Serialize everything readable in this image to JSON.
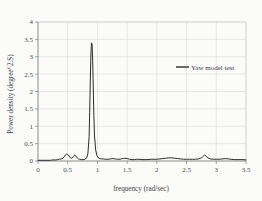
{
  "chart_data": {
    "type": "line",
    "title": "",
    "xlabel": "frequency (rad/sec)",
    "ylabel": "Power density (degree^2.S)",
    "xlim": [
      0,
      3.5
    ],
    "ylim": [
      0,
      4
    ],
    "xticks": [
      "0",
      "0.5",
      "1",
      "1.5",
      "2",
      "2.5",
      "3",
      "3.5"
    ],
    "xtick_values": [
      0,
      0.5,
      1,
      1.5,
      2,
      2.5,
      3,
      3.5
    ],
    "yticks": [
      "0",
      "0.5",
      "1",
      "1.5",
      "2",
      "2.5",
      "3",
      "3.5",
      "4"
    ],
    "ytick_values": [
      0,
      0.5,
      1,
      1.5,
      2,
      2.5,
      3,
      3.5,
      4
    ],
    "grid": true,
    "legend_position": "upper right",
    "series": [
      {
        "name": "Yaw model test",
        "color": "#2b2b2b",
        "x": [
          0.0,
          0.05,
          0.1,
          0.15,
          0.2,
          0.25,
          0.3,
          0.33,
          0.36,
          0.39,
          0.42,
          0.44,
          0.46,
          0.48,
          0.5,
          0.52,
          0.54,
          0.56,
          0.58,
          0.6,
          0.62,
          0.64,
          0.66,
          0.68,
          0.7,
          0.73,
          0.76,
          0.79,
          0.82,
          0.84,
          0.86,
          0.87,
          0.88,
          0.89,
          0.9,
          0.91,
          0.92,
          0.93,
          0.94,
          0.95,
          0.97,
          0.99,
          1.01,
          1.04,
          1.07,
          1.1,
          1.14,
          1.18,
          1.22,
          1.26,
          1.3,
          1.34,
          1.38,
          1.42,
          1.46,
          1.5,
          1.54,
          1.58,
          1.62,
          1.66,
          1.7,
          1.75,
          1.8,
          1.85,
          1.9,
          1.95,
          2.0,
          2.05,
          2.1,
          2.15,
          2.2,
          2.25,
          2.3,
          2.35,
          2.4,
          2.45,
          2.5,
          2.55,
          2.6,
          2.65,
          2.7,
          2.74,
          2.77,
          2.8,
          2.83,
          2.86,
          2.9,
          2.95,
          3.0,
          3.05,
          3.1,
          3.15,
          3.2,
          3.25,
          3.3,
          3.35,
          3.4,
          3.45,
          3.5
        ],
        "y": [
          0.02,
          0.02,
          0.02,
          0.02,
          0.02,
          0.03,
          0.03,
          0.04,
          0.05,
          0.06,
          0.08,
          0.12,
          0.17,
          0.2,
          0.19,
          0.15,
          0.1,
          0.08,
          0.09,
          0.14,
          0.17,
          0.14,
          0.09,
          0.06,
          0.05,
          0.04,
          0.04,
          0.05,
          0.09,
          0.22,
          0.7,
          1.4,
          2.3,
          3.05,
          3.4,
          3.35,
          2.9,
          2.1,
          1.3,
          0.75,
          0.32,
          0.16,
          0.1,
          0.07,
          0.06,
          0.06,
          0.05,
          0.05,
          0.06,
          0.07,
          0.06,
          0.05,
          0.05,
          0.07,
          0.08,
          0.07,
          0.05,
          0.04,
          0.04,
          0.05,
          0.05,
          0.04,
          0.04,
          0.04,
          0.05,
          0.05,
          0.05,
          0.06,
          0.07,
          0.08,
          0.09,
          0.09,
          0.08,
          0.07,
          0.06,
          0.05,
          0.05,
          0.05,
          0.05,
          0.05,
          0.06,
          0.08,
          0.12,
          0.17,
          0.14,
          0.09,
          0.06,
          0.05,
          0.05,
          0.05,
          0.06,
          0.07,
          0.06,
          0.05,
          0.04,
          0.04,
          0.04,
          0.04,
          0.03
        ]
      }
    ]
  },
  "legend": {
    "entries": [
      {
        "label": "Yaw model test"
      }
    ]
  }
}
